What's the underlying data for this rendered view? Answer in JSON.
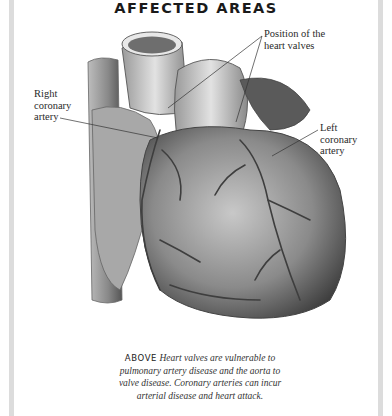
{
  "title": "AFFECTED AREAS",
  "labels": {
    "valves": [
      "Position of the",
      "heart valves"
    ],
    "right_coronary": [
      "Right",
      "coronary",
      "artery"
    ],
    "left_coronary": [
      "Left",
      "coronary",
      "artery"
    ]
  },
  "caption": {
    "lead": "ABOVE",
    "text": " Heart valves are vulnerable to pulmonary artery disease and the aorta to valve disease. Coronary arteries can incur arterial disease and heart attack."
  },
  "colors": {
    "border": "#dcdcdc",
    "illustration_dark": "#4a4a4a",
    "illustration_light": "#d8d8d8"
  }
}
